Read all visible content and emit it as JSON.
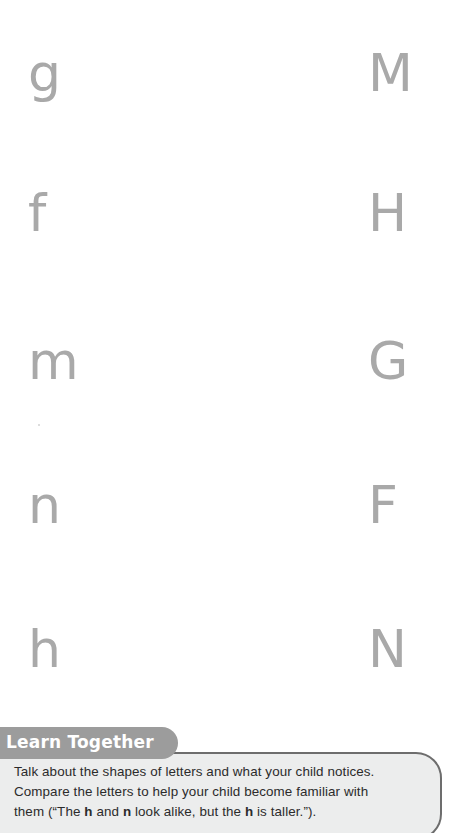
{
  "page": {
    "background_color": "#ffffff",
    "letter_color": "#a9a9a9"
  },
  "letter_sheet": {
    "name": "letter-matching-worksheet",
    "rows": [
      {
        "lowercase": "g",
        "uppercase": "M",
        "y": 73
      },
      {
        "lowercase": "f",
        "uppercase": "H",
        "y": 213
      },
      {
        "lowercase": "m",
        "uppercase": "G",
        "y": 361
      },
      {
        "lowercase": "n",
        "uppercase": "F",
        "y": 505
      },
      {
        "lowercase": "h",
        "uppercase": "N",
        "y": 649
      }
    ]
  },
  "callout": {
    "title": "Learn Together",
    "title_background": "#9c9c9c",
    "title_color": "#ffffff",
    "box_background": "#eceded",
    "box_border": "#6d6d6d",
    "lines": [
      {
        "parts": [
          {
            "text": "Talk about the shapes of letters and what your child notices.",
            "bold": false
          }
        ]
      },
      {
        "parts": [
          {
            "text": "Compare the letters to help your child become familiar with",
            "bold": false
          }
        ]
      },
      {
        "parts": [
          {
            "text": "them (“The ",
            "bold": false
          },
          {
            "text": "h",
            "bold": true
          },
          {
            "text": " and ",
            "bold": false
          },
          {
            "text": "n",
            "bold": true
          },
          {
            "text": " look alike, but the ",
            "bold": false
          },
          {
            "text": "h",
            "bold": true
          },
          {
            "text": " is taller.”).",
            "bold": false
          }
        ]
      }
    ]
  }
}
